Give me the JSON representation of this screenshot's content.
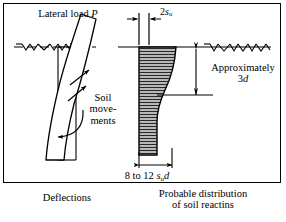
{
  "figure": {
    "border_color": "#000000",
    "background_color": "#ffffff",
    "line_color": "#000000",
    "fill_color": "#b3b3b3",
    "width_px": 286,
    "height_px": 222
  },
  "labels": {
    "lateral_load": "Lateral load ",
    "lateral_load_symbol": "P",
    "su_prefix": "2",
    "su_symbol": "s",
    "su_subscript": "u",
    "approximately": "Approximately",
    "approximately_value_num": "3",
    "approximately_value_sym": "d",
    "soil_movements": "Soil move- ments",
    "soil_movements_line1": "Soil",
    "soil_movements_line2": "move-",
    "soil_movements_line3": "ments",
    "width_range": "8 to 12 ",
    "width_symbol_s": "s",
    "width_subscript": "u",
    "width_symbol_d": "d"
  },
  "captions": {
    "left": "Deflections",
    "right_line1": "Probable distribution",
    "right_line2": "of soil reactins"
  },
  "geometry": {
    "ground_line_y": 47,
    "pile_top_x": 96,
    "pile_bottom_x": 40,
    "pressure_left_x": 138,
    "pressure_right_x": 177,
    "pressure_top_y": 47,
    "pressure_bottom_y": 155,
    "dim_3d_x": 196,
    "dim_3d_top_y": 48,
    "dim_3d_bottom_y": 96,
    "hatch_spacing_px": 3
  }
}
